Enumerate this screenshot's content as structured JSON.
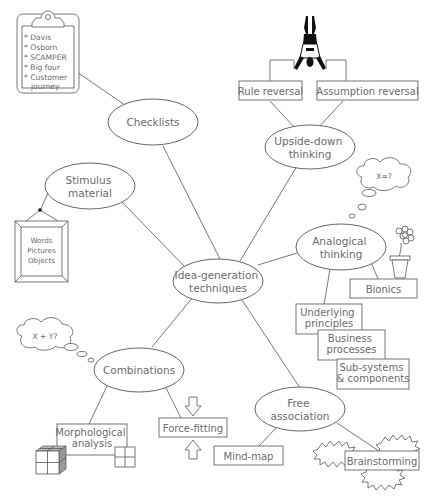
{
  "diagram": {
    "center": {
      "line1": "Idea-generation",
      "line2": "techniques"
    },
    "nodes": {
      "checklists": {
        "line1": "Checklists"
      },
      "upside_down": {
        "line1": "Upside-down",
        "line2": "thinking"
      },
      "stimulus": {
        "line1": "Stimulus",
        "line2": "material"
      },
      "analogical": {
        "line1": "Analogical",
        "line2": "thinking"
      },
      "combinations": {
        "line1": "Combinations"
      },
      "free_association": {
        "line1": "Free",
        "line2": "association"
      }
    },
    "checklist_items": [
      "* Davis",
      "* Osborn",
      "* SCAMPER",
      "* Big four",
      "* Customer",
      "journey"
    ],
    "stimulus_items": [
      "Words",
      "Pictures",
      "Objects"
    ],
    "upside_down_boxes": {
      "rule": "Rule reversal",
      "assumption": "Assumption reversal"
    },
    "analogical_thought": "X=?",
    "analogical_boxes": {
      "bionics": "Bionics",
      "underlying": {
        "line1": "Underlying",
        "line2": "principles"
      },
      "business": {
        "line1": "Business",
        "line2": "processes"
      },
      "subsystems": {
        "line1": "Sub-systems",
        "line2": "& components"
      }
    },
    "combinations_thought": "X + Y?",
    "combinations_boxes": {
      "morphological": {
        "line1": "Morphological",
        "line2": "analysis"
      },
      "force_fitting": "Force-fitting"
    },
    "free_association_boxes": {
      "mind_map": "Mind-map",
      "brainstorming": "Brainstorming"
    },
    "icons": {
      "clipboard": "clipboard-icon",
      "handstand": "upside-down-person-icon",
      "picture_frame": "picture-frame-icon",
      "thought_cloud": "thought-cloud-icon",
      "flower_pot": "flower-pot-icon",
      "cube": "cube-grid-icon",
      "square_grid": "square-grid-icon",
      "arrows": "converging-arrows-icon",
      "starbursts": "starburst-icon"
    }
  }
}
